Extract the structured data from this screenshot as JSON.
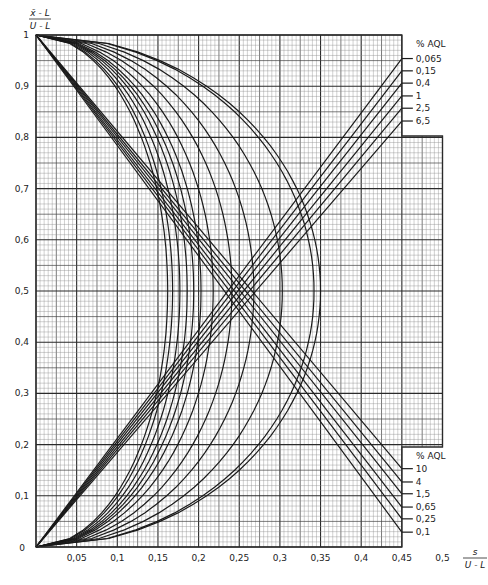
{
  "chart_data": {
    "type": "line",
    "title": "",
    "xlabel": "s / (U - L)",
    "ylabel": "(x̄ - L) / (U - L)",
    "xlim": [
      0,
      0.5
    ],
    "ylim": [
      0,
      1
    ],
    "grid": true,
    "x_ticks": [
      {
        "value": 0,
        "label": "0"
      },
      {
        "value": 0.05,
        "label": "0,05"
      },
      {
        "value": 0.1,
        "label": "0,1"
      },
      {
        "value": 0.15,
        "label": "0,15"
      },
      {
        "value": 0.2,
        "label": "0,2"
      },
      {
        "value": 0.25,
        "label": "0,25"
      },
      {
        "value": 0.3,
        "label": "0,3"
      },
      {
        "value": 0.35,
        "label": "0,35"
      },
      {
        "value": 0.4,
        "label": "0,4"
      },
      {
        "value": 0.45,
        "label": "0,45"
      },
      {
        "value": 0.5,
        "label": "0,5"
      }
    ],
    "y_ticks": [
      {
        "value": 0.1,
        "label": "0,1"
      },
      {
        "value": 0.2,
        "label": "0,2"
      },
      {
        "value": 0.3,
        "label": "0,3"
      },
      {
        "value": 0.4,
        "label": "0,4"
      },
      {
        "value": 0.5,
        "label": "0,5"
      },
      {
        "value": 0.6,
        "label": "0,6"
      },
      {
        "value": 0.7,
        "label": "0,7"
      },
      {
        "value": 0.8,
        "label": "0,8"
      },
      {
        "value": 0.9,
        "label": "0,9"
      },
      {
        "value": 1,
        "label": "1"
      }
    ],
    "legend_upper": {
      "title": "% AQL",
      "position": "right-top",
      "entries": [
        {
          "label": "0,065",
          "end_y": 0.954
        },
        {
          "label": "0,15",
          "end_y": 0.93
        },
        {
          "label": "0,4",
          "end_y": 0.906
        },
        {
          "label": "1",
          "end_y": 0.881
        },
        {
          "label": "2,5",
          "end_y": 0.857
        },
        {
          "label": "6,5",
          "end_y": 0.832
        }
      ]
    },
    "legend_lower": {
      "title": "% AQL",
      "position": "right-bottom",
      "entries": [
        {
          "label": "10",
          "end_y": 0.153
        },
        {
          "label": "4",
          "end_y": 0.127
        },
        {
          "label": "1,5",
          "end_y": 0.104
        },
        {
          "label": "0,65",
          "end_y": 0.078
        },
        {
          "label": "0,25",
          "end_y": 0.055
        },
        {
          "label": "0,1",
          "end_y": 0.029
        }
      ]
    },
    "series": [
      {
        "name": "0,065",
        "peak_x": 0.162
      },
      {
        "name": "0,1",
        "peak_x": 0.168
      },
      {
        "name": "0,15",
        "peak_x": 0.177
      },
      {
        "name": "0,25",
        "peak_x": 0.186
      },
      {
        "name": "0,4",
        "peak_x": 0.194
      },
      {
        "name": "0,65",
        "peak_x": 0.203
      },
      {
        "name": "1",
        "peak_x": 0.218
      },
      {
        "name": "1,5",
        "peak_x": 0.241
      },
      {
        "name": "2,5",
        "peak_x": 0.268
      },
      {
        "name": "4",
        "peak_x": 0.303
      },
      {
        "name": "6,5",
        "peak_x": 0.342
      },
      {
        "name": "10",
        "peak_x": 0.35
      }
    ],
    "upper_tangent_lines": [
      {
        "aql": "0,065",
        "from": [
          0.0,
          0.0
        ],
        "to": [
          0.45,
          0.954
        ]
      },
      {
        "aql": "0,15",
        "from": [
          0.0,
          0.0
        ],
        "to": [
          0.45,
          0.93
        ]
      },
      {
        "aql": "0,4",
        "from": [
          0.0,
          0.0
        ],
        "to": [
          0.45,
          0.906
        ]
      },
      {
        "aql": "1",
        "from": [
          0.0,
          0.0
        ],
        "to": [
          0.45,
          0.881
        ]
      },
      {
        "aql": "2,5",
        "from": [
          0.0,
          0.0
        ],
        "to": [
          0.45,
          0.857
        ]
      },
      {
        "aql": "6,5",
        "from": [
          0.0,
          0.0
        ],
        "to": [
          0.45,
          0.832
        ]
      }
    ],
    "lower_tangent_lines": [
      {
        "aql": "10",
        "from": [
          0.0,
          1.0
        ],
        "to": [
          0.45,
          0.153
        ]
      },
      {
        "aql": "4",
        "from": [
          0.0,
          1.0
        ],
        "to": [
          0.45,
          0.127
        ]
      },
      {
        "aql": "1,5",
        "from": [
          0.0,
          1.0
        ],
        "to": [
          0.45,
          0.104
        ]
      },
      {
        "aql": "0,65",
        "from": [
          0.0,
          1.0
        ],
        "to": [
          0.45,
          0.078
        ]
      },
      {
        "aql": "0,25",
        "from": [
          0.0,
          1.0
        ],
        "to": [
          0.45,
          0.055
        ]
      },
      {
        "aql": "0,1",
        "from": [
          0.0,
          1.0
        ],
        "to": [
          0.45,
          0.029
        ]
      }
    ]
  },
  "labels": {
    "y_axis_numerator": "x̄ - L",
    "y_axis_denominator": "U - L",
    "x_axis_numerator": "s",
    "x_axis_denominator": "U - L",
    "origin": "0"
  },
  "colors": {
    "line": "#1a1a1a",
    "grid_minor": "#8a8a8a",
    "grid_major": "#2a2a2a",
    "background": "#ffffff"
  }
}
